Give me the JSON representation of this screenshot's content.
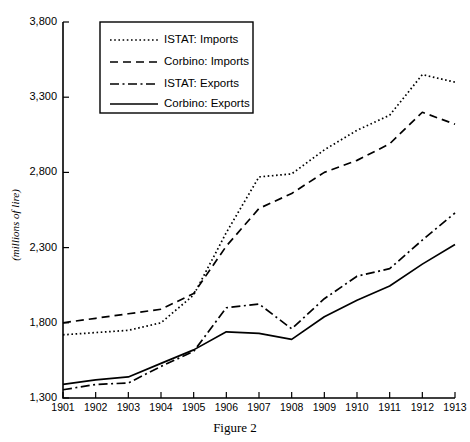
{
  "chart_data": {
    "type": "line",
    "title": "",
    "caption": "Figure 2",
    "xlabel": "",
    "ylabel": "(millions of lire)",
    "x": [
      1901,
      1902,
      1903,
      1904,
      1905,
      1906,
      1907,
      1908,
      1909,
      1910,
      1911,
      1912,
      1913
    ],
    "xtick_labels": [
      "1901",
      "1902",
      "1903",
      "1904",
      "1905",
      "1906",
      "1907",
      "1908",
      "1909",
      "1910",
      "1911",
      "1912",
      "1913"
    ],
    "ytick_labels": [
      "1,300",
      "1,800",
      "2,300",
      "2,800",
      "3,300",
      "3,800"
    ],
    "ytick_values": [
      1300,
      1800,
      2300,
      2800,
      3300,
      3800
    ],
    "xlim": [
      1901,
      1913
    ],
    "ylim": [
      1300,
      3800
    ],
    "grid": false,
    "legend_position": "top-left",
    "series": [
      {
        "name": "ISTAT: Imports",
        "style": "dotted",
        "dash": "1.6,2.6",
        "width": 1.7,
        "values": [
          1720,
          1735,
          1750,
          1800,
          1985,
          2400,
          2770,
          2790,
          2950,
          3080,
          3180,
          3450,
          3400
        ]
      },
      {
        "name": "Corbino: Imports",
        "style": "dashed",
        "dash": "8,5",
        "width": 1.7,
        "values": [
          1800,
          1830,
          1860,
          1890,
          1995,
          2310,
          2560,
          2660,
          2800,
          2880,
          2990,
          3200,
          3120
        ]
      },
      {
        "name": "ISTAT: Exports",
        "style": "dashdot",
        "dash": "9,3.5,2,3.5",
        "width": 1.7,
        "values": [
          1355,
          1390,
          1400,
          1510,
          1610,
          1900,
          1925,
          1760,
          1960,
          2110,
          2160,
          2350,
          2530
        ]
      },
      {
        "name": "Corbino: Exports",
        "style": "solid",
        "dash": "0",
        "width": 1.7,
        "values": [
          1390,
          1420,
          1440,
          1530,
          1620,
          1740,
          1730,
          1690,
          1840,
          1950,
          2045,
          2190,
          2320
        ]
      }
    ]
  },
  "legend": {
    "items": [
      {
        "label": "ISTAT: Imports"
      },
      {
        "label": "Corbino: Imports"
      },
      {
        "label": "ISTAT: Exports"
      },
      {
        "label": "Corbino: Exports"
      }
    ]
  }
}
